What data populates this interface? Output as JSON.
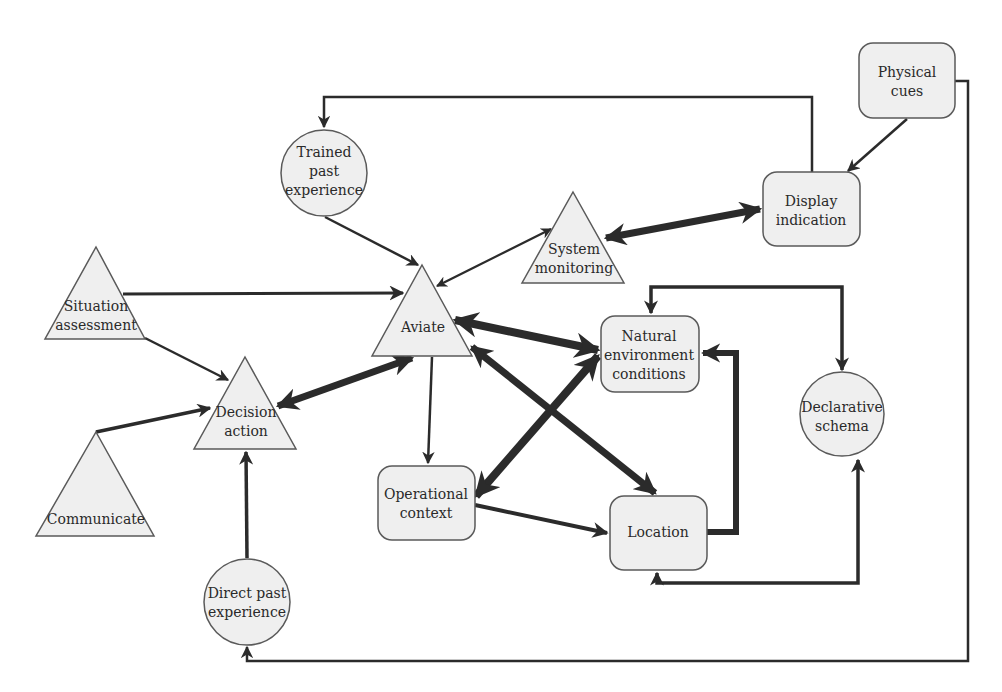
{
  "diagram": {
    "type": "flow/concept diagram",
    "nodes": {
      "trained_past_experience": {
        "shape": "circle",
        "lines": [
          "Trained",
          "past",
          "experience"
        ]
      },
      "physical_cues": {
        "shape": "rounded-rect",
        "lines": [
          "Physical",
          "cues"
        ]
      },
      "display_indication": {
        "shape": "rounded-rect",
        "lines": [
          "Display",
          "indication"
        ]
      },
      "system_monitoring": {
        "shape": "triangle",
        "lines": [
          "System",
          "monitoring"
        ]
      },
      "situation_assessment": {
        "shape": "triangle",
        "lines": [
          "Situation",
          "assessment"
        ]
      },
      "aviate": {
        "shape": "triangle",
        "lines": [
          "Aviate"
        ]
      },
      "natural_environment_conditions": {
        "shape": "rounded-rect",
        "lines": [
          "Natural",
          "environment",
          "conditions"
        ]
      },
      "declarative_schema": {
        "shape": "circle",
        "lines": [
          "Declarative",
          "schema"
        ]
      },
      "decision_action": {
        "shape": "triangle",
        "lines": [
          "Decision",
          "action"
        ]
      },
      "communicate": {
        "shape": "triangle",
        "lines": [
          "Communicate"
        ]
      },
      "operational_context": {
        "shape": "rounded-rect",
        "lines": [
          "Operational",
          "context"
        ]
      },
      "location": {
        "shape": "rounded-rect",
        "lines": [
          "Location"
        ]
      },
      "direct_past_experience": {
        "shape": "circle",
        "lines": [
          "Direct past",
          "experience"
        ]
      }
    },
    "edges": [
      {
        "from": "display_indication",
        "to": "trained_past_experience",
        "weight": "thin",
        "direction": "one-way"
      },
      {
        "from": "physical_cues",
        "to": "display_indication",
        "weight": "thin",
        "direction": "one-way"
      },
      {
        "from": "physical_cues",
        "to": "direct_past_experience",
        "weight": "thin",
        "direction": "one-way"
      },
      {
        "from": "trained_past_experience",
        "to": "aviate",
        "weight": "thin",
        "direction": "one-way"
      },
      {
        "from": "system_monitoring",
        "to": "aviate",
        "weight": "thin",
        "direction": "two-way"
      },
      {
        "from": "system_monitoring",
        "to": "display_indication",
        "weight": "heavy",
        "direction": "two-way"
      },
      {
        "from": "situation_assessment",
        "to": "aviate",
        "weight": "thin",
        "direction": "one-way"
      },
      {
        "from": "situation_assessment",
        "to": "decision_action",
        "weight": "thin",
        "direction": "one-way"
      },
      {
        "from": "aviate",
        "to": "natural_environment_conditions",
        "weight": "heavy",
        "direction": "two-way"
      },
      {
        "from": "aviate",
        "to": "location",
        "weight": "heavy",
        "direction": "two-way"
      },
      {
        "from": "aviate",
        "to": "decision_action",
        "weight": "heavy",
        "direction": "two-way"
      },
      {
        "from": "aviate",
        "to": "operational_context",
        "weight": "thin",
        "direction": "one-way"
      },
      {
        "from": "operational_context",
        "to": "natural_environment_conditions",
        "weight": "heavy",
        "direction": "two-way"
      },
      {
        "from": "operational_context",
        "to": "location",
        "weight": "medium",
        "direction": "one-way"
      },
      {
        "from": "location",
        "to": "natural_environment_conditions",
        "weight": "heavy",
        "direction": "one-way"
      },
      {
        "from": "natural_environment_conditions",
        "to": "declarative_schema",
        "weight": "medium",
        "direction": "two-way"
      },
      {
        "from": "declarative_schema",
        "to": "location",
        "weight": "medium",
        "direction": "two-way"
      },
      {
        "from": "communicate",
        "to": "decision_action",
        "weight": "medium",
        "direction": "one-way"
      },
      {
        "from": "direct_past_experience",
        "to": "decision_action",
        "weight": "medium",
        "direction": "one-way"
      }
    ],
    "colors": {
      "node_fill": "#efefef",
      "node_stroke": "#5a5a5a",
      "edge": "#2b2b2b",
      "text": "#2a2a2a"
    }
  }
}
